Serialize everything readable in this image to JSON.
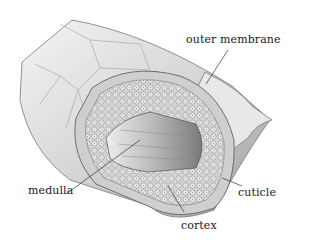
{
  "diagram": {
    "labels": {
      "outer_membrane": "outer membrane",
      "medulla": "medulla",
      "cortex": "cortex",
      "cuticle": "cuticle"
    }
  }
}
